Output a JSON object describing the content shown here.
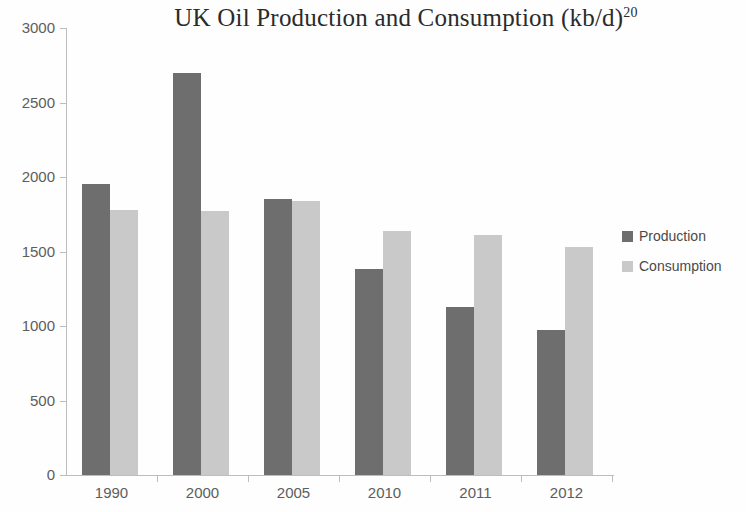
{
  "chart_data": {
    "type": "bar",
    "title": "UK Oil Production and Consumption (kb/d)",
    "title_footnote": "20",
    "xlabel": "",
    "ylabel": "",
    "categories": [
      "1990",
      "2000",
      "2005",
      "2010",
      "2011",
      "2012"
    ],
    "series": [
      {
        "name": "Production",
        "color": "#6e6e6e",
        "values": [
          1950,
          2700,
          1850,
          1380,
          1130,
          975
        ]
      },
      {
        "name": "Consumption",
        "color": "#c9c9c9",
        "values": [
          1780,
          1770,
          1840,
          1640,
          1610,
          1530
        ]
      }
    ],
    "ylim": [
      0,
      3000
    ],
    "yticks": [
      0,
      500,
      1000,
      1500,
      2000,
      2500,
      3000
    ],
    "ytick_labels": [
      "0",
      "500",
      "1000",
      "1500",
      "2000",
      "2500",
      "3000"
    ],
    "grid": false,
    "legend_position": "right"
  }
}
